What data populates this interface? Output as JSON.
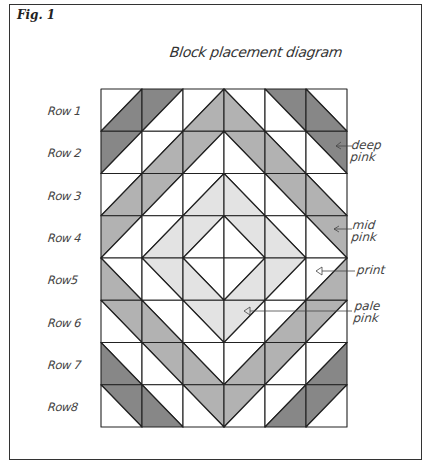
{
  "figure": {
    "label": "Fig. 1",
    "title": "Block placement diagram"
  },
  "rows": [
    {
      "label": "Row 1"
    },
    {
      "label": "Row 2"
    },
    {
      "label": "Row 3"
    },
    {
      "label": "Row 4"
    },
    {
      "label": "Row5"
    },
    {
      "label": "Row 6"
    },
    {
      "label": "Row 7"
    },
    {
      "label": "Row8"
    }
  ],
  "callouts": {
    "deep_pink": {
      "line1": "deep",
      "line2": "pink"
    },
    "mid_pink": {
      "line1": "mid",
      "line2": "pink"
    },
    "print": {
      "line1": "print"
    },
    "pale_pink": {
      "line1": "pale",
      "line2": "pink"
    }
  },
  "colors": {
    "white": "#ffffff",
    "pale": "#e3e3e3",
    "mid": "#b2b2b2",
    "deep": "#878787",
    "line": "#222222"
  },
  "grid": {
    "columns": 6,
    "rows": 8,
    "x0": 101,
    "y0": 89,
    "cell_w": 41,
    "cell_h": 42.25,
    "cells_legend": "each cell: [diagonal, first-triangle, second-triangle]; '/' = [upper-left, lower-right]; '\\' = [upper-right, lower-left]",
    "cells": [
      [
        [
          "/",
          "white",
          "deep"
        ],
        [
          "/",
          "deep",
          "white"
        ],
        [
          "/",
          "white",
          "mid"
        ],
        [
          "\\",
          "white",
          "mid"
        ],
        [
          "\\",
          "deep",
          "white"
        ],
        [
          "\\",
          "white",
          "deep"
        ]
      ],
      [
        [
          "/",
          "deep",
          "white"
        ],
        [
          "/",
          "white",
          "mid"
        ],
        [
          "/",
          "mid",
          "white"
        ],
        [
          "\\",
          "mid",
          "white"
        ],
        [
          "\\",
          "white",
          "mid"
        ],
        [
          "\\",
          "deep",
          "white"
        ]
      ],
      [
        [
          "/",
          "white",
          "mid"
        ],
        [
          "/",
          "mid",
          "white"
        ],
        [
          "/",
          "white",
          "pale"
        ],
        [
          "\\",
          "white",
          "pale"
        ],
        [
          "\\",
          "mid",
          "white"
        ],
        [
          "\\",
          "white",
          "mid"
        ]
      ],
      [
        [
          "/",
          "mid",
          "white"
        ],
        [
          "/",
          "white",
          "pale"
        ],
        [
          "/",
          "pale",
          "white"
        ],
        [
          "\\",
          "pale",
          "white"
        ],
        [
          "\\",
          "white",
          "pale"
        ],
        [
          "\\",
          "mid",
          "white"
        ]
      ],
      [
        [
          "\\",
          "white",
          "mid"
        ],
        [
          "\\",
          "pale",
          "white"
        ],
        [
          "\\",
          "white",
          "pale"
        ],
        [
          "/",
          "white",
          "pale"
        ],
        [
          "/",
          "pale",
          "white"
        ],
        [
          "/",
          "white",
          "mid"
        ]
      ],
      [
        [
          "\\",
          "mid",
          "white"
        ],
        [
          "\\",
          "white",
          "mid"
        ],
        [
          "\\",
          "pale",
          "white"
        ],
        [
          "/",
          "pale",
          "white"
        ],
        [
          "/",
          "white",
          "mid"
        ],
        [
          "/",
          "mid",
          "white"
        ]
      ],
      [
        [
          "\\",
          "white",
          "deep"
        ],
        [
          "\\",
          "mid",
          "white"
        ],
        [
          "\\",
          "white",
          "mid"
        ],
        [
          "/",
          "white",
          "mid"
        ],
        [
          "/",
          "mid",
          "white"
        ],
        [
          "/",
          "white",
          "deep"
        ]
      ],
      [
        [
          "\\",
          "deep",
          "white"
        ],
        [
          "\\",
          "white",
          "deep"
        ],
        [
          "\\",
          "mid",
          "white"
        ],
        [
          "/",
          "mid",
          "white"
        ],
        [
          "/",
          "white",
          "deep"
        ],
        [
          "/",
          "deep",
          "white"
        ]
      ]
    ]
  }
}
